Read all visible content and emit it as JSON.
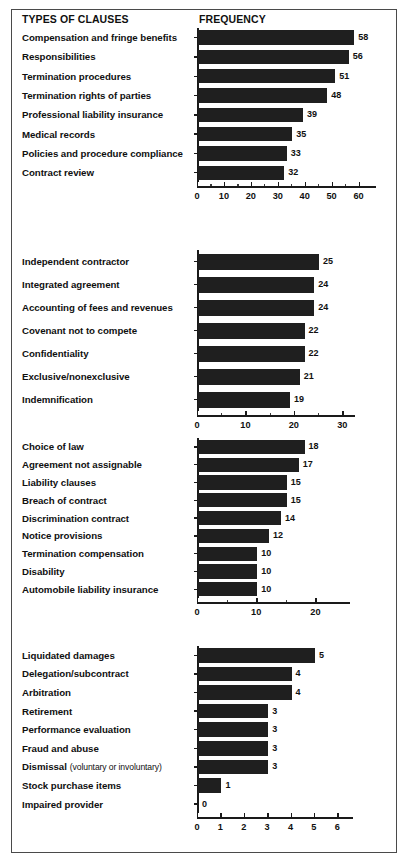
{
  "header": {
    "types_label": "TYPES OF CLAUSES",
    "frequency_label": "FREQUENCY"
  },
  "chart_data": {
    "type": "bar",
    "title": "TYPES OF CLAUSES",
    "xlabel": "FREQUENCY",
    "ylabel": "",
    "orientation": "horizontal",
    "grid": false,
    "legend": "none",
    "panels": [
      {
        "id": "panel-1",
        "categories": [
          "Compensation and fringe benefits",
          "Responsibilities",
          "Termination procedures",
          "Termination rights of parties",
          "Professional liability insurance",
          "Medical records",
          "Policies and procedure compliance",
          "Contract review"
        ],
        "values": [
          58,
          56,
          51,
          48,
          39,
          35,
          33,
          32
        ],
        "xlim": [
          0,
          65
        ],
        "xticks": [
          0,
          10,
          20,
          30,
          40,
          50,
          60
        ],
        "xticklabels": [
          "0",
          "10",
          "20",
          "30",
          "40",
          "50",
          "60"
        ]
      },
      {
        "id": "panel-2",
        "categories": [
          "Independent contractor",
          "Integrated agreement",
          "Accounting of fees and revenues",
          "Covenant not to compete",
          "Confidentiality",
          "Exclusive/nonexclusive",
          "Indemnification"
        ],
        "values": [
          25,
          24,
          24,
          22,
          22,
          21,
          19
        ],
        "xlim": [
          0,
          32
        ],
        "xticks": [
          0,
          10,
          20,
          30
        ],
        "xticklabels": [
          "0",
          "10",
          "20",
          "30"
        ]
      },
      {
        "id": "panel-3",
        "categories": [
          "Choice of law",
          "Agreement not assignable",
          "Liability clauses",
          "Breach of contract",
          "Discrimination contract",
          "Notice provisions",
          "Termination compensation",
          "Disability",
          "Automobile liability insurance"
        ],
        "values": [
          18,
          17,
          15,
          15,
          14,
          12,
          10,
          10,
          10
        ],
        "xlim": [
          0,
          25
        ],
        "xticks": [
          0,
          10,
          20
        ],
        "xticklabels": [
          "0",
          "10",
          "20"
        ]
      },
      {
        "id": "panel-4",
        "categories": [
          "Liquidated damages",
          "Delegation/subcontract",
          "Arbitration",
          "Retirement",
          "Performance evaluation",
          "Fraud and abuse",
          "Dismissal",
          "Stock purchase items",
          "Impaired provider"
        ],
        "category_notes": [
          "",
          "",
          "",
          "",
          "",
          "",
          "(voluntary or involuntary)",
          "",
          ""
        ],
        "values": [
          5,
          4,
          4,
          3,
          3,
          3,
          3,
          1,
          0
        ],
        "xlim": [
          0,
          6.5
        ],
        "xticks": [
          0,
          1,
          2,
          3,
          4,
          5,
          6
        ],
        "xticklabels": [
          "0",
          "1",
          "2",
          "3",
          "4",
          "5",
          "6"
        ]
      }
    ]
  },
  "colors": {
    "bar": "#1f1f1f",
    "axis": "#1a1a1a",
    "border": "#4a4a4a",
    "background": "#ffffff",
    "text": "#101010"
  }
}
